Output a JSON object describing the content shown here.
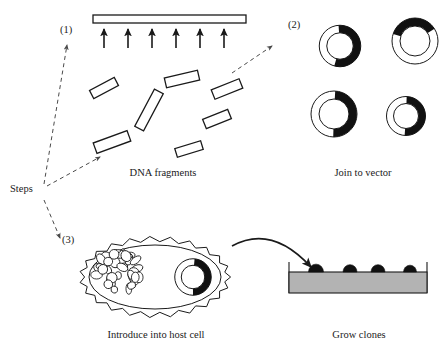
{
  "figure": {
    "title_visible": false,
    "background_color": "#ffffff",
    "ink_color": "#1a1a1a",
    "dash_color": "#4a4a4a",
    "agar_color": "#b3b3b3"
  },
  "steps_label": {
    "text": "Steps",
    "x": 10,
    "y": 192
  },
  "step_numbers": [
    {
      "id": "step-1",
      "text": "(1)",
      "x": 60,
      "y": 33
    },
    {
      "id": "step-2",
      "text": "(2)",
      "x": 288,
      "y": 28
    },
    {
      "id": "step-3",
      "text": "(3)",
      "x": 62,
      "y": 243
    }
  ],
  "captions": [
    {
      "id": "caption-dna-fragments",
      "text": "DNA fragments",
      "x": 163,
      "y": 176
    },
    {
      "id": "caption-join-to-vector",
      "text": "Join to vector",
      "x": 363,
      "y": 176
    },
    {
      "id": "caption-introduce-host-cell",
      "text": "Introduce into host cell",
      "x": 156,
      "y": 338
    },
    {
      "id": "caption-grow-clones",
      "text": "Grow clones",
      "x": 359,
      "y": 338
    }
  ],
  "panel_1": {
    "name": "dna-source-and-fragments",
    "chromosome_bar": {
      "x": 93,
      "y": 15,
      "width": 153,
      "height": 8
    },
    "cleavage_arrow_xs": [
      104,
      128,
      152,
      176,
      200,
      224
    ],
    "cleavage_arrow_top_y": 29,
    "cleavage_arrow_bottom_y": 48,
    "fragments": [
      {
        "cx": 104,
        "cy": 88,
        "w": 28,
        "h": 9,
        "rot": -28
      },
      {
        "cx": 182,
        "cy": 79,
        "w": 34,
        "h": 10,
        "rot": -13
      },
      {
        "cx": 227,
        "cy": 89,
        "w": 30,
        "h": 10,
        "rot": -22
      },
      {
        "cx": 149,
        "cy": 110,
        "w": 42,
        "h": 10,
        "rot": -62
      },
      {
        "cx": 217,
        "cy": 119,
        "w": 27,
        "h": 10,
        "rot": -22
      },
      {
        "cx": 112,
        "cy": 142,
        "w": 36,
        "h": 11,
        "rot": -20
      },
      {
        "cx": 189,
        "cy": 149,
        "w": 27,
        "h": 9,
        "rot": -17
      }
    ]
  },
  "panel_2": {
    "name": "recombinant-plasmids",
    "plasmids": [
      {
        "id": "plasmid-top-left",
        "cx": 340,
        "cy": 46,
        "r": 17,
        "thickness": 7.5,
        "insert_start_deg": 356,
        "insert_end_deg": 196,
        "label": "vector with insert"
      },
      {
        "id": "plasmid-top-right",
        "cx": 415,
        "cy": 41,
        "r": 19,
        "thickness": 8,
        "insert_start_deg": 288,
        "insert_end_deg": 58,
        "label": "vector with insert"
      },
      {
        "id": "plasmid-bottom-left",
        "cx": 334,
        "cy": 114,
        "r": 19,
        "thickness": 8,
        "insert_start_deg": 3,
        "insert_end_deg": 182,
        "label": "vector with insert"
      },
      {
        "id": "plasmid-bottom-right",
        "cx": 406,
        "cy": 116,
        "r": 16,
        "thickness": 7,
        "insert_start_deg": 2,
        "insert_end_deg": 184,
        "label": "vector with insert"
      }
    ]
  },
  "panel_3": {
    "name": "host-cell",
    "cell": {
      "cx": 155,
      "cy": 277,
      "rx": 73,
      "ry": 38,
      "membrane_ripples": 46,
      "ripple_amplitude": 2.6
    },
    "chromosome_tangle": {
      "cx": 118,
      "cy": 272,
      "blob_count": 34
    },
    "internal_plasmid": {
      "cx": 193,
      "cy": 277,
      "r": 15,
      "thickness": 6.5,
      "insert_start_deg": 5,
      "insert_end_deg": 180
    }
  },
  "panel_4": {
    "name": "agar-plate-with-colonies",
    "plate": {
      "x": 289,
      "y": 272,
      "width": 138,
      "height": 21,
      "wall_top_y": 262
    },
    "colonies": [
      {
        "cx": 316,
        "cy": 272,
        "r": 7.5
      },
      {
        "cx": 350,
        "cy": 272,
        "r": 7.0
      },
      {
        "cx": 378,
        "cy": 272,
        "r": 7.0
      },
      {
        "cx": 410,
        "cy": 272,
        "r": 6.5
      }
    ]
  },
  "connectors": [
    {
      "id": "arrow-steps-to-1",
      "kind": "dashed-arrow",
      "from": [
        44,
        184
      ],
      "to": [
        67,
        45
      ]
    },
    {
      "id": "arrow-steps-to-2",
      "kind": "dashed-arrow",
      "from": [
        47,
        186
      ],
      "to": [
        100,
        157
      ]
    },
    {
      "id": "arrow-fragments-to-vectors",
      "kind": "dashed-arrow",
      "from": [
        232,
        73
      ],
      "to": [
        272,
        46
      ]
    },
    {
      "id": "arrow-steps-to-3",
      "kind": "dashed-arrow",
      "from": [
        44,
        200
      ],
      "to": [
        60,
        238
      ]
    },
    {
      "id": "arrow-cell-to-plate",
      "kind": "curved-solid-arrow",
      "from": [
        232,
        246
      ],
      "to": [
        311,
        267
      ]
    }
  ]
}
